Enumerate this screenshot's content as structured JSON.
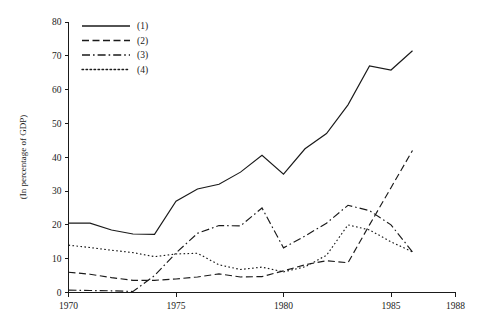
{
  "chart_data": {
    "type": "line",
    "title": "",
    "xlabel": "",
    "ylabel": "(In percentage of GDP)",
    "xlim": [
      1970,
      1988
    ],
    "ylim": [
      0,
      80
    ],
    "grid": false,
    "legend_position": "top-left",
    "x_ticks": [
      1970,
      1975,
      1980,
      1985,
      1988
    ],
    "x_tick_labels": [
      "1970",
      "1975",
      "1980",
      "1985",
      "1988"
    ],
    "y_ticks": [
      0,
      10,
      20,
      30,
      40,
      50,
      60,
      70,
      80
    ],
    "y_tick_labels": [
      "0",
      "10",
      "20",
      "30",
      "40",
      "50",
      "60",
      "70",
      "80"
    ],
    "x": [
      1970,
      1971,
      1972,
      1973,
      1974,
      1975,
      1976,
      1977,
      1978,
      1979,
      1980,
      1981,
      1982,
      1983,
      1984,
      1985,
      1986
    ],
    "series": [
      {
        "name": "(1)",
        "label": "(1)",
        "style": "solid",
        "dash": "none",
        "color": "#1a1a1a",
        "values": [
          20.5,
          20.5,
          18.5,
          17.3,
          17.2,
          27.0,
          30.6,
          32.0,
          35.6,
          40.6,
          35.0,
          42.5,
          47.0,
          55.5,
          67.0,
          65.8,
          71.5
        ]
      },
      {
        "name": "(2)",
        "label": "(2)",
        "style": "dashed",
        "dash": "7,3.5",
        "color": "#1a1a1a",
        "values": [
          6.0,
          5.4,
          4.4,
          3.6,
          3.6,
          4.0,
          4.6,
          5.5,
          4.6,
          4.7,
          6.4,
          8.2,
          9.4,
          8.8,
          20.0,
          31.0,
          42.0
        ]
      },
      {
        "name": "(3)",
        "label": "(3)",
        "style": "dash-dot",
        "dash": "8,3,1.6,3",
        "color": "#1a1a1a",
        "values": [
          0.7,
          0.6,
          0.5,
          0.3,
          5.0,
          11.7,
          17.5,
          19.8,
          19.7,
          25.0,
          13.2,
          16.7,
          20.5,
          25.8,
          24.2,
          20.0,
          12.0
        ]
      },
      {
        "name": "(4)",
        "label": "(4)",
        "style": "dotted",
        "dash": "1.6,2.4",
        "color": "#1a1a1a",
        "values": [
          14.0,
          13.3,
          12.5,
          11.8,
          10.6,
          11.4,
          11.6,
          8.2,
          6.8,
          7.5,
          6.1,
          7.6,
          11.0,
          20.0,
          18.5,
          15.0,
          12.0
        ]
      }
    ]
  },
  "legend": {
    "entries": [
      {
        "label": "(1)",
        "style": "solid"
      },
      {
        "label": "(2)",
        "style": "dashed"
      },
      {
        "label": "(3)",
        "style": "dash-dot"
      },
      {
        "label": "(4)",
        "style": "dotted"
      }
    ]
  },
  "axes": {
    "y_axis_title": "(In percentage of GDP)"
  }
}
